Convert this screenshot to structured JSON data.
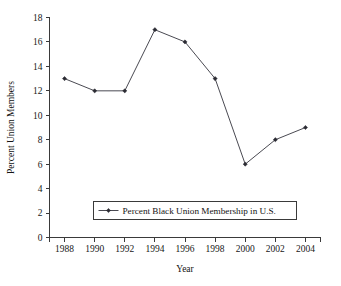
{
  "chart_data": {
    "type": "line",
    "title": "",
    "subtitle": "",
    "xlabel": "Year",
    "ylabel": "Percent Union Members",
    "categories": [
      1988,
      1990,
      1992,
      1994,
      1996,
      1998,
      2000,
      2002,
      2004
    ],
    "x_tick_labels": [
      "1988",
      "1990",
      "1992",
      "1994",
      "1996",
      "1998",
      "2000",
      "2002",
      "2004"
    ],
    "y_tick_labels": [
      "0",
      "2",
      "4",
      "6",
      "8",
      "10",
      "12",
      "14",
      "16",
      "18"
    ],
    "y_ticks": [
      0,
      2,
      4,
      6,
      8,
      10,
      12,
      14,
      16,
      18
    ],
    "ylim": [
      0,
      18
    ],
    "xlim": [
      1987,
      2005
    ],
    "grid": false,
    "legend_position": "inside-bottom-center",
    "series": [
      {
        "name": "Percent Black Union Membership in U.S.",
        "values": [
          13,
          12,
          12,
          17,
          16,
          13,
          6,
          8,
          9
        ],
        "marker": "diamond",
        "color": "#4a4a52"
      }
    ],
    "annotations": []
  },
  "legend": {
    "entries": [
      {
        "label": "Percent Black Union Membership in U.S."
      }
    ]
  },
  "colors": {
    "background": "#ffffff",
    "axis": "#3a3a3a",
    "series": "#4a4a52",
    "marker": "#2b2b33",
    "text": "#141414"
  }
}
